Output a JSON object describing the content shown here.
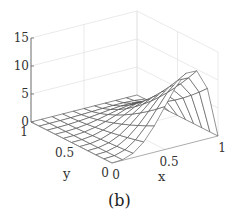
{
  "chart_data": {
    "type": "surface",
    "title": "",
    "caption": "(b)",
    "xlabel": "x",
    "ylabel": "y",
    "zlabel": "",
    "xlim": [
      0,
      1
    ],
    "ylim": [
      0,
      1
    ],
    "zlim": [
      0,
      15
    ],
    "x_ticks": [
      "0",
      "0.5",
      "1"
    ],
    "y_ticks": [
      "0",
      "0.5",
      "1"
    ],
    "z_ticks": [
      "0",
      "5",
      "10",
      "15"
    ],
    "grid": true,
    "grid_resolution": 11,
    "surface_description": "Wireframe mesh rising from ~0 at x=0 to a peak of ~13 near x≈0.75, y=0, falling to 0 at x=1; decays toward 0 as y→1",
    "peak": {
      "x": 0.75,
      "y": 0,
      "z": 13
    },
    "x": [
      0,
      0.1,
      0.2,
      0.3,
      0.4,
      0.5,
      0.6,
      0.7,
      0.8,
      0.9,
      1.0
    ],
    "y": [
      0,
      0.1,
      0.2,
      0.3,
      0.4,
      0.5,
      0.6,
      0.7,
      0.8,
      0.9,
      1.0
    ],
    "z_at_y0": [
      0,
      0.1,
      0.8,
      2.3,
      4.7,
      7.7,
      10.6,
      12.6,
      12.6,
      9.0,
      0
    ]
  }
}
